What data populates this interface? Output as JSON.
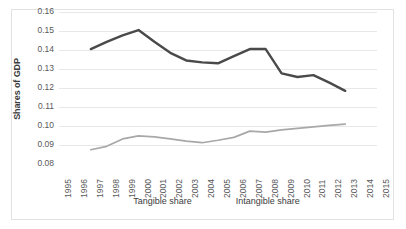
{
  "chart_data": {
    "type": "line",
    "title": "",
    "xlabel": "",
    "ylabel": "Shares of GDP",
    "ylim": [
      0.08,
      0.16
    ],
    "ytick_labels": [
      "0.16",
      "0.15",
      "0.14",
      "0.13",
      "0.12",
      "0.11",
      "0.10",
      "0.09",
      "0.08"
    ],
    "ytick_values": [
      0.16,
      0.15,
      0.14,
      0.13,
      0.12,
      0.11,
      0.1,
      0.09,
      0.08
    ],
    "grid": true,
    "legend_position": "bottom",
    "categories": [
      1995,
      1996,
      1997,
      1998,
      1999,
      2000,
      2001,
      2002,
      2003,
      2004,
      2005,
      2006,
      2007,
      2008,
      2009,
      2010,
      2011,
      2012,
      2013,
      2014,
      2015
    ],
    "xtick_labels": [
      "1995",
      "1996",
      "1997",
      "1998",
      "1999",
      "2000",
      "2001",
      "2002",
      "2003",
      "2004",
      "2005",
      "2006",
      "2007",
      "2008",
      "2009",
      "2010",
      "2011",
      "2012",
      "2013",
      "2014",
      "2015"
    ],
    "series": [
      {
        "name": "Tangible share",
        "color": "#4a4a4a",
        "x": [
          1997,
          1998,
          1999,
          2000,
          2001,
          2002,
          2003,
          2004,
          2005,
          2006,
          2007,
          2008,
          2009,
          2010,
          2011,
          2012,
          2013
        ],
        "values": [
          0.1405,
          0.1443,
          0.1477,
          0.1505,
          0.1443,
          0.1385,
          0.1345,
          0.1335,
          0.133,
          0.1368,
          0.1405,
          0.1405,
          0.1277,
          0.1258,
          0.1268,
          0.1228,
          0.1185
        ]
      },
      {
        "name": "Intangible share",
        "color": "#a8a8a8",
        "x": [
          1997,
          1998,
          1999,
          2000,
          2001,
          2002,
          2003,
          2004,
          2005,
          2006,
          2007,
          2008,
          2009,
          2010,
          2011,
          2012,
          2013
        ],
        "values": [
          0.0875,
          0.0893,
          0.0932,
          0.0948,
          0.0943,
          0.0932,
          0.092,
          0.0912,
          0.0925,
          0.094,
          0.0973,
          0.0968,
          0.098,
          0.0988,
          0.0995,
          0.1003,
          0.101
        ]
      }
    ]
  },
  "legend": {
    "entries": [
      {
        "label": "Tangible share"
      },
      {
        "label": "Intangible share"
      }
    ]
  },
  "axes": {
    "y_title": "Shares of GDP"
  },
  "colors": {
    "tangible": "#4a4a4a",
    "intangible": "#a8a8a8",
    "grid": "#e8e8e8",
    "frame": "#e2e2e2",
    "tick_text": "#595959"
  }
}
